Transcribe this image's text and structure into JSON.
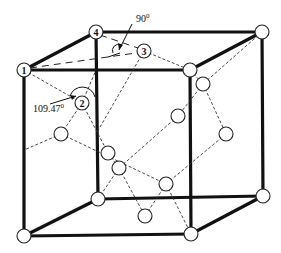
{
  "diagram": {
    "type": "crystal-structure",
    "labels": {
      "atom1": "1",
      "atom2": "2",
      "atom3": "3",
      "atom4": "4"
    },
    "angles": {
      "tetrahedral": "109.47",
      "tetrahedral_unit": "0",
      "right": "90",
      "right_unit": "0"
    },
    "colors": {
      "edge": "#111111",
      "bond": "#333333",
      "atom_fill": "#ffffff"
    }
  }
}
